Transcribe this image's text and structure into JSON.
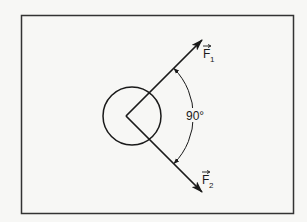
{
  "diagram": {
    "type": "force-vector-diagram",
    "forces": [
      {
        "label": "F",
        "subscript": "1",
        "vector": true,
        "direction": "up-right"
      },
      {
        "label": "F",
        "subscript": "2",
        "vector": true,
        "direction": "down-right"
      }
    ],
    "angle_label": "90°",
    "object": "circle",
    "colors": {
      "line": "#1a1a1a",
      "background": "#f7f7f5",
      "frame": "#333333"
    }
  }
}
